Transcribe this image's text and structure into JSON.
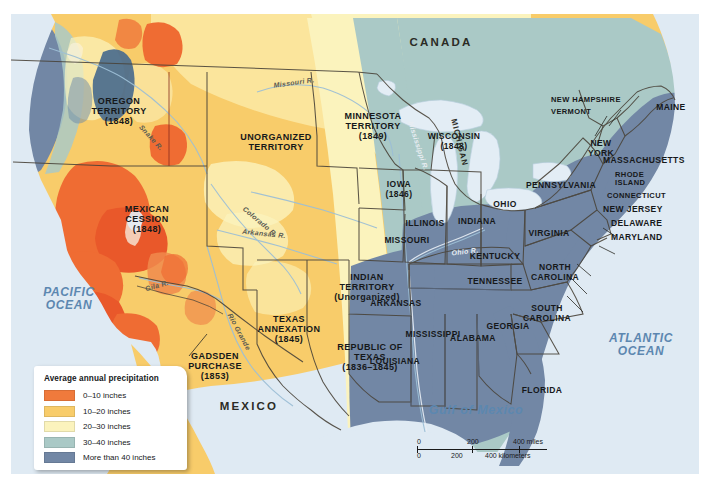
{
  "map": {
    "title_absent": "",
    "legend": {
      "title": "Average annual precipitation",
      "entries": [
        {
          "label": "0–10 inches",
          "color": "#f07a3c"
        },
        {
          "label": "10–20 inches",
          "color": "#f8cc6a"
        },
        {
          "label": "20–30 inches",
          "color": "#fbf3bd"
        },
        {
          "label": "30–40 inches",
          "color": "#aac9c6"
        },
        {
          "label": "More than 40 inches",
          "color": "#7287a5"
        }
      ]
    },
    "scale": {
      "miles": {
        "ticks": [
          "0",
          "200",
          "400 miles"
        ]
      },
      "kilometers": {
        "ticks": [
          "0",
          "200",
          "400 kilometers"
        ]
      }
    },
    "countries": [
      {
        "name": "CANADA"
      },
      {
        "name": "MEXICO"
      }
    ],
    "oceans": [
      {
        "name": "PACIFIC\nOCEAN"
      },
      {
        "name": "ATLANTIC\nOCEAN"
      },
      {
        "name": "Gulf of Mexico"
      }
    ],
    "territories": [
      {
        "name": "OREGON\nTERRITORY\n(1848)"
      },
      {
        "name": "MEXICAN\nCESSION\n(1848)"
      },
      {
        "name": "UNORGANIZED\nTERRITORY"
      },
      {
        "name": "MINNESOTA\nTERRITORY\n(1849)"
      },
      {
        "name": "INDIAN\nTERRITORY\n(Unorganized)"
      },
      {
        "name": "TEXAS\nANNEXATION\n(1845)"
      },
      {
        "name": "REPUBLIC OF\nTEXAS\n(1836–1845)"
      },
      {
        "name": "GADSDEN\nPURCHASE\n(1853)"
      }
    ],
    "states": [
      {
        "name": "WISCONSIN\n(1848)"
      },
      {
        "name": "IOWA\n(1846)"
      },
      {
        "name": "MICHIGAN"
      },
      {
        "name": "ILLINOIS"
      },
      {
        "name": "INDIANA"
      },
      {
        "name": "OHIO"
      },
      {
        "name": "MISSOURI"
      },
      {
        "name": "KENTUCKY"
      },
      {
        "name": "TENNESSEE"
      },
      {
        "name": "ARKANSAS"
      },
      {
        "name": "MISSISSIPPI"
      },
      {
        "name": "ALABAMA"
      },
      {
        "name": "LOUISIANA"
      },
      {
        "name": "GEORGIA"
      },
      {
        "name": "FLORIDA"
      },
      {
        "name": "SOUTH\nCAROLINA"
      },
      {
        "name": "NORTH\nCAROLINA"
      },
      {
        "name": "VIRGINIA"
      },
      {
        "name": "MARYLAND"
      },
      {
        "name": "DELAWARE"
      },
      {
        "name": "NEW JERSEY"
      },
      {
        "name": "PENNSYLVANIA"
      },
      {
        "name": "NEW\nYORK"
      },
      {
        "name": "CONNECTICUT"
      },
      {
        "name": "RHODE\nISLAND"
      },
      {
        "name": "MASSACHUSETTS"
      },
      {
        "name": "VERMONT"
      },
      {
        "name": "NEW HAMPSHIRE"
      },
      {
        "name": "MAINE"
      }
    ],
    "rivers": [
      {
        "name": "Missouri R."
      },
      {
        "name": "Snake R."
      },
      {
        "name": "Colorado R."
      },
      {
        "name": "Arkansas R."
      },
      {
        "name": "Rio Grande"
      },
      {
        "name": "Gila R."
      },
      {
        "name": "Mississippi R."
      },
      {
        "name": "Ohio R."
      }
    ],
    "colors": {
      "ocean": "#dfeaf3",
      "band_0_10": "#f07a3c",
      "band_10_20": "#f8cc6a",
      "band_20_30": "#fbf3bd",
      "band_30_40": "#aac9c6",
      "band_40_plus": "#7287a5",
      "border": "#4a443a",
      "lake": "#d6e4ef"
    }
  }
}
